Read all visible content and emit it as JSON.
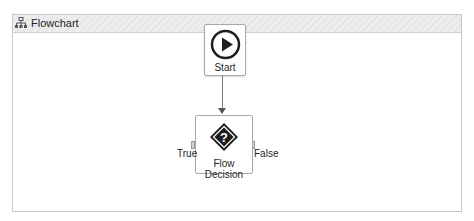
{
  "header": {
    "title": "Flowchart",
    "icon": "flowchart-icon"
  },
  "nodes": {
    "start": {
      "label": "Start",
      "icon": "play-icon"
    },
    "decision": {
      "label": "Flow Decision",
      "icon": "question-diamond-icon",
      "true_label": "True",
      "false_label": "False"
    }
  },
  "colors": {
    "node_border": "#a9a9a9",
    "connector": "#7a7a7a",
    "icon_dark": "#1e1e1e"
  }
}
